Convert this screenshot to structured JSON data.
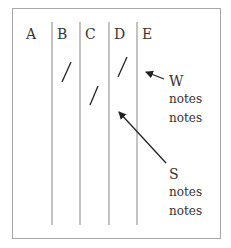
{
  "columns": [
    {
      "label": "A",
      "x": 23
    },
    {
      "label": "B",
      "x": 57
    },
    {
      "label": "C",
      "x": 85
    },
    {
      "label": "D",
      "x": 114
    },
    {
      "label": "E",
      "x": 142
    }
  ],
  "divider_x": [
    52,
    80,
    109,
    137
  ],
  "divider_y": [
    22,
    225
  ],
  "annotations": {
    "w": {
      "title": "W",
      "lines": [
        "notes",
        "notes"
      ]
    },
    "s": {
      "title": "S",
      "lines": [
        "notes",
        "notes"
      ]
    }
  },
  "colors": {
    "line": "#9a9a9a",
    "stroke": "#222222",
    "border": "#a8a8a8"
  }
}
